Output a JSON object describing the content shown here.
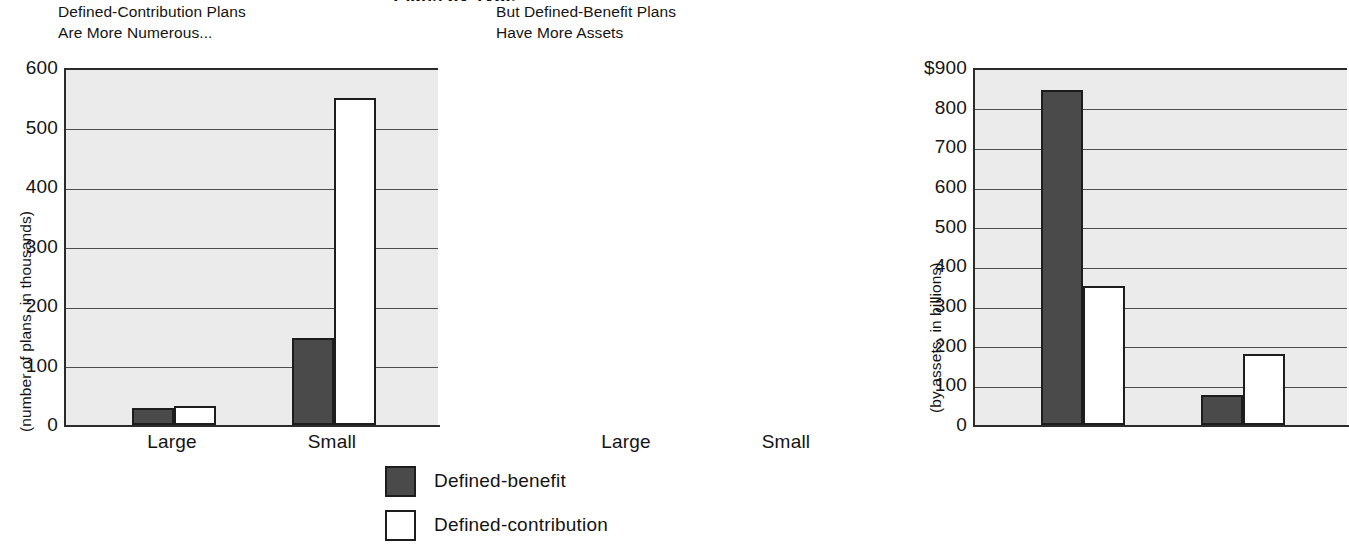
{
  "super_title": "Plans by Type",
  "chart_data": [
    {
      "type": "bar",
      "title": "Defined-Contribution Plans\nAre More Numerous...",
      "xlabel": "",
      "ylabel": "(number of plans, in thousands)",
      "categories": [
        "Large",
        "Small"
      ],
      "series": [
        {
          "name": "Defined-benefit",
          "values": [
            28,
            147
          ],
          "color": "#4a4a4a"
        },
        {
          "name": "Defined-contribution",
          "values": [
            32,
            550
          ],
          "color": "#ffffff"
        }
      ],
      "ylim": [
        0,
        600
      ],
      "yticks": [
        "0",
        "100",
        "200",
        "300",
        "400",
        "500",
        "600"
      ],
      "ytick_values": [
        0,
        100,
        200,
        300,
        400,
        500,
        600
      ],
      "grid": true,
      "legend_position": "bottom-center"
    },
    {
      "type": "bar",
      "title": "But Defined-Benefit Plans\nHave More Assets",
      "xlabel": "",
      "ylabel": "(by assets, in billions)",
      "categories": [
        "Large",
        "Small"
      ],
      "series": [
        {
          "name": "Defined-benefit",
          "values": [
            845,
            75
          ],
          "color": "#4a4a4a"
        },
        {
          "name": "Defined-contribution",
          "values": [
            350,
            180
          ],
          "color": "#ffffff"
        }
      ],
      "ylim": [
        0,
        900
      ],
      "yticks": [
        "0",
        "100",
        "200",
        "300",
        "400",
        "500",
        "600",
        "700",
        "800",
        "$900"
      ],
      "ytick_values": [
        0,
        100,
        200,
        300,
        400,
        500,
        600,
        700,
        800,
        900
      ],
      "grid": true,
      "legend_position": "bottom-center"
    }
  ],
  "legend": {
    "items": [
      {
        "label": "Defined-benefit",
        "color": "#4a4a4a"
      },
      {
        "label": "Defined-contribution",
        "color": "#ffffff"
      }
    ]
  },
  "colors": {
    "defined_benefit": "#4a4a4a",
    "defined_contribution": "#ffffff",
    "plot_background": "#ebebeb",
    "axis": "#2b2b2b",
    "gridline": "#4d4d4d"
  }
}
